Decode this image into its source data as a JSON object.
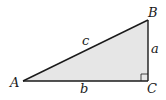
{
  "diagram": {
    "type": "right-triangle",
    "fill_color": "#e6e6e6",
    "stroke_color": "#1a1a1a",
    "vertices": {
      "A": {
        "label": "A",
        "x": 23,
        "y": 81
      },
      "B": {
        "label": "B",
        "x": 148,
        "y": 20
      },
      "C": {
        "label": "C",
        "x": 148,
        "y": 81
      }
    },
    "sides": {
      "a": {
        "label": "a",
        "between": "B-C"
      },
      "b": {
        "label": "b",
        "between": "A-C"
      },
      "c": {
        "label": "c",
        "between": "A-B"
      }
    },
    "right_angle_at": "C"
  }
}
